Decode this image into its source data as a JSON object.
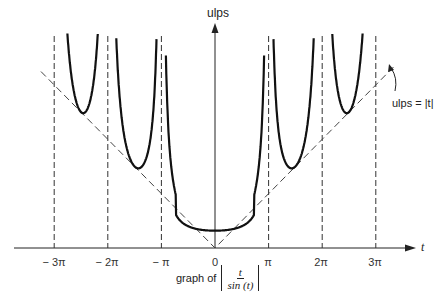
{
  "chart_data": {
    "type": "line",
    "xlabel": "t",
    "ylabel": "ulps",
    "x_ticks": [
      "-3π",
      "-2π",
      "-π",
      "0",
      "π",
      "2π",
      "3π"
    ],
    "x_tick_values": [
      -9.4248,
      -6.2832,
      -3.1416,
      0,
      3.1416,
      6.2832,
      9.4248
    ],
    "xlim": [
      -10.2,
      10.5
    ],
    "grid": false,
    "asymptotes_dashed_at": [
      "-3π",
      "-2π",
      "-π",
      "π",
      "2π",
      "3π"
    ],
    "series": [
      {
        "name": "|t / sin(t)|",
        "style": "solid bold",
        "x": [
          -8.9,
          -8.2,
          -7.9,
          -7.6,
          -7.3,
          -7.0,
          -6.6,
          -6.4,
          -6.1,
          -5.8,
          -5.4,
          -5.0,
          -4.7,
          -4.4,
          -4.0,
          -3.6,
          -3.3,
          -3.0,
          -2.6,
          -2.0,
          -1.4,
          -0.8,
          0,
          0.8,
          1.4,
          2.0,
          2.6,
          3.0,
          3.3,
          3.6,
          4.0,
          4.4,
          4.7,
          5.0,
          5.4,
          5.8,
          6.1,
          6.4,
          6.6,
          7.0,
          7.3,
          7.6,
          7.9,
          8.2,
          8.9
        ],
        "values": [
          18.4,
          8.9,
          8.0,
          7.7,
          8.4,
          10.7,
          21.6,
          54,
          33,
          12.4,
          7.0,
          5.2,
          4.7,
          4.6,
          5.2,
          8.1,
          21.4,
          21.3,
          5.1,
          2.2,
          1.4,
          1.1,
          1.0,
          1.1,
          1.4,
          2.2,
          5.1,
          21.3,
          21.4,
          8.1,
          5.2,
          4.6,
          4.7,
          5.2,
          7.0,
          12.4,
          33,
          54,
          21.6,
          10.7,
          8.4,
          7.7,
          8.0,
          8.9,
          18.4
        ]
      },
      {
        "name": "ulps = |t|",
        "style": "dashed",
        "x": [
          -10.2,
          0,
          10.5
        ],
        "values": [
          10.2,
          0,
          10.5
        ]
      }
    ],
    "annotations": [
      {
        "text": "ulps = |t|",
        "points_to": "dashed line |t| near t≈3π"
      }
    ]
  },
  "labels": {
    "y_axis": "ulps",
    "x_axis": "t",
    "annotation": "ulps = |t|",
    "caption_prefix": "graph of",
    "caption_num": "t",
    "caption_den": "sin (t)",
    "ticks": [
      "− 3π",
      "− 2π",
      "− π",
      "0",
      "π",
      "2π",
      "3π"
    ]
  }
}
